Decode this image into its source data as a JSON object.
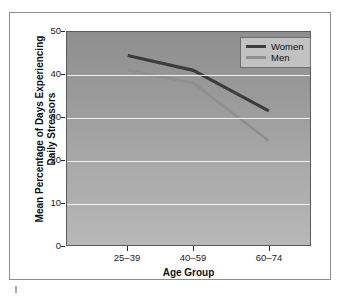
{
  "chart_data": {
    "type": "line",
    "title": "",
    "xlabel": "Age Group",
    "ylabel": "Mean Percentage of Days Experiencing Daily Stressors",
    "categories": [
      "25–39",
      "40–59",
      "60–74"
    ],
    "series": [
      {
        "name": "Women",
        "values": [
          44.5,
          41.0,
          31.5
        ],
        "color": "#3c3c3c"
      },
      {
        "name": "Men",
        "values": [
          41.0,
          38.0,
          24.5
        ],
        "color": "#8f8f8f"
      }
    ],
    "ylim": [
      0,
      50
    ],
    "yticks": [
      0,
      10,
      20,
      30,
      40,
      50
    ],
    "ytick_labels": [
      "0",
      "10",
      "20",
      "30",
      "40",
      "50"
    ],
    "grid": true,
    "legend_position": "top-right"
  },
  "axis": {
    "y_title_line1": "Mean Percentage of Days Experiencing",
    "y_title_line2": "Daily Stressors",
    "x_title": "Age Group"
  },
  "legend": {
    "entries": [
      {
        "label": "Women"
      },
      {
        "label": "Men"
      }
    ]
  },
  "colors": {
    "women_line": "#3c3c3c",
    "men_line": "#8f8f8f",
    "gridline": "#f2f2f2",
    "plot_bg_top": "#8e8e8e",
    "plot_bg_bottom": "#b8b8b8",
    "frame_border": "#8d8d8d",
    "axis_text": "#1b1b1b"
  }
}
